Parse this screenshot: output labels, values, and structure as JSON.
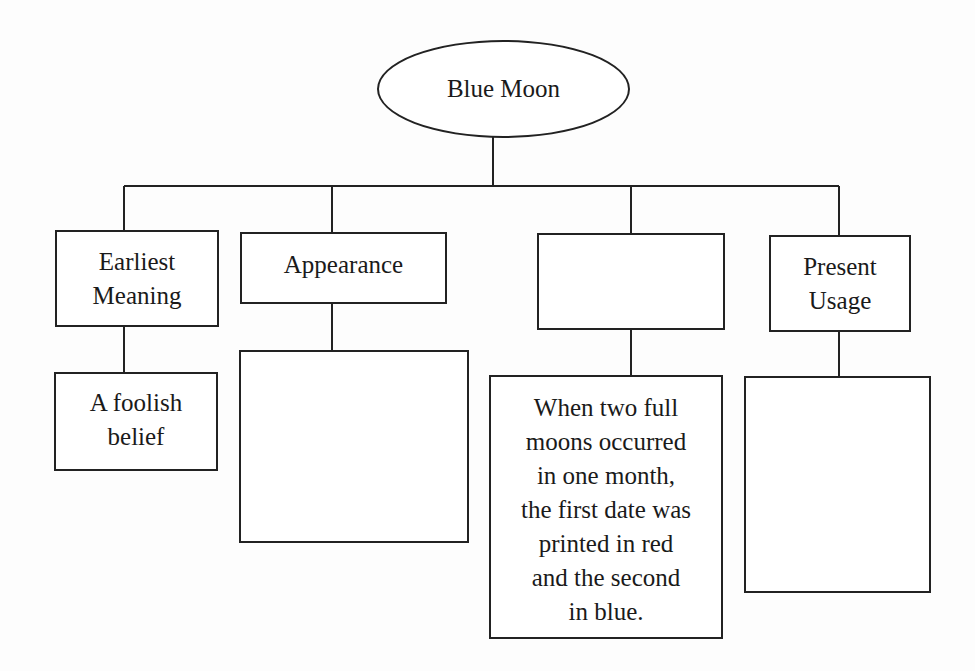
{
  "diagram": {
    "type": "tree",
    "root": {
      "label": "Blue Moon"
    },
    "categories": [
      {
        "label": "Earliest\nMeaning",
        "answer": "A foolish\nbelief"
      },
      {
        "label": "Appearance",
        "answer": ""
      },
      {
        "label": "",
        "answer": "When two full\nmoons occurred\nin one month,\nthe first date was\nprinted in red\nand the second\nin blue."
      },
      {
        "label": "Present\nUsage",
        "answer": ""
      }
    ],
    "colors": {
      "line": "#222222",
      "box_fill": "#ffffff",
      "background": "#fdfdfd",
      "text": "#1a1a1a"
    }
  }
}
